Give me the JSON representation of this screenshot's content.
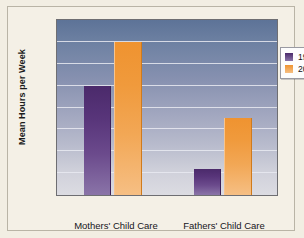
{
  "chart_data": {
    "type": "bar",
    "title": "",
    "xlabel": "",
    "ylabel": "Mean Hours per Week",
    "ylim": [
      0,
      16
    ],
    "ytick_step": 2,
    "yticks": [
      "16",
      "14",
      "12",
      "10",
      "8",
      "6",
      "4",
      "2",
      "0"
    ],
    "grid": true,
    "legend_position": "top-right",
    "categories": [
      "Mothers' Child Care",
      "Fathers' Child Care"
    ],
    "series": [
      {
        "name": "1965",
        "color": "#5a3480",
        "values": [
          10.0,
          2.4
        ]
      },
      {
        "name": "2011",
        "color": "#f09a3c",
        "values": [
          14.0,
          7.0
        ]
      }
    ]
  },
  "legend": {
    "entries": [
      {
        "label": "1965",
        "swatch": "legend-swatch-1965"
      },
      {
        "label": "2011",
        "swatch": "legend-swatch-2011"
      }
    ]
  },
  "colors": {
    "page_background": "#f2eee3",
    "plot_top": "#5d7397",
    "plot_bottom": "#dcdce2",
    "gridline": "#e9eaf1",
    "series_1965": "#5a3480",
    "series_2011": "#f09a3c",
    "axis": "#6e6e72"
  }
}
